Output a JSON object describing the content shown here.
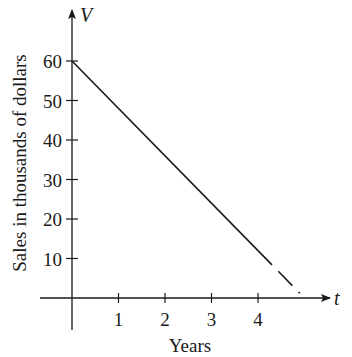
{
  "chart_data": {
    "type": "line",
    "title": "",
    "xlabel": "Years",
    "ylabel": "Sales in thousands of dollars",
    "x_axis_var": "t",
    "y_axis_var": "V",
    "x_ticks": [
      1,
      2,
      3,
      4
    ],
    "y_ticks": [
      10,
      20,
      30,
      40,
      50,
      60
    ],
    "xlim": [
      0,
      5
    ],
    "ylim": [
      0,
      60
    ],
    "grid": false,
    "legend": null,
    "series": [
      {
        "name": "V(t) solid",
        "style": "solid",
        "x": [
          0,
          4
        ],
        "y": [
          60,
          12
        ]
      },
      {
        "name": "V(t) extrapolated",
        "style": "dashed",
        "x": [
          4,
          4.9
        ],
        "y": [
          12,
          1.2
        ]
      }
    ],
    "colors": {
      "axis": "#1a1a1a",
      "line": "#1a1a1a",
      "background": "#ffffff"
    }
  },
  "layout": {
    "origin_px": [
      72,
      298
    ],
    "px_per_t": 46.5,
    "px_per_v": 3.95,
    "x_axis_end_px": 330,
    "y_axis_top_px": 10,
    "y_axis_bottom_px": 330,
    "x_axis_left_px": 40
  }
}
